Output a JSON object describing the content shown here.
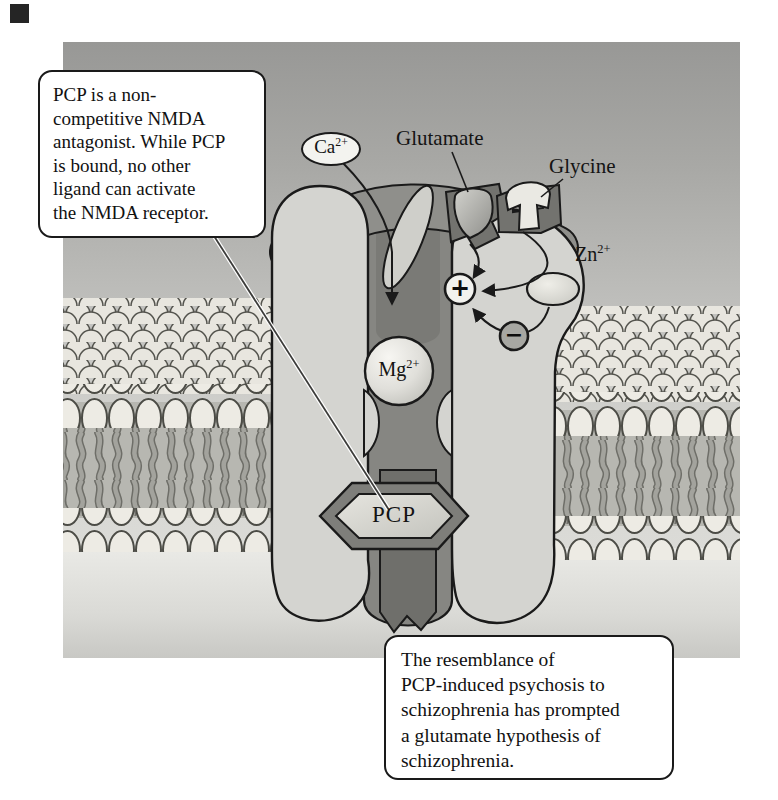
{
  "figure": {
    "callouts": {
      "pcp_note": "PCP is a non-\ncompetitive NMDA\nantagonist. While PCP\nis bound, no other\nligand can activate\nthe NMDA receptor.",
      "schizophrenia_note": "The resemblance of\nPCP-induced psychosis to\nschizophrenia has prompted\na glutamate hypothesis of\nschizophrenia."
    },
    "labels": {
      "glutamate": "Glutamate",
      "glycine": "Glycine",
      "ca": {
        "base": "Ca",
        "sup": "2+"
      },
      "zn": {
        "base": "Zn",
        "sup": "2+"
      },
      "mg": {
        "base": "Mg",
        "sup": "2+"
      },
      "pcp": "PCP",
      "plus_sign": "+",
      "minus_sign": "−"
    },
    "colors": {
      "panel_top_gray": "#9b9b99",
      "panel_bottom_gray": "#d6d6d2",
      "receptor_light": "#d4d4d0",
      "channel_dark": "#868682",
      "pocket_dark": "#73736f",
      "membrane_head": "#ece9e2",
      "membrane_tail": "#a0a099",
      "outline_black": "#1a1a1a",
      "callout_bg": "#ffffff"
    }
  }
}
